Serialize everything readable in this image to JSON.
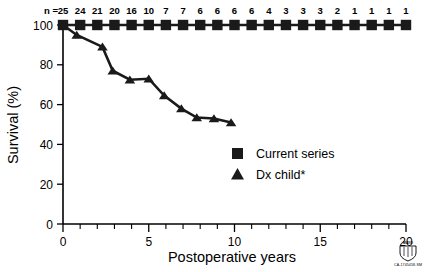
{
  "chart_data": {
    "type": "line",
    "title": "",
    "xlabel": "Postoperative years",
    "ylabel": "Survival (%)",
    "xlim": [
      0,
      20
    ],
    "ylim": [
      0,
      100
    ],
    "x_ticks": [
      0,
      5,
      10,
      15,
      20
    ],
    "x_tick_labels": [
      "0",
      "5",
      "10",
      "15",
      "20"
    ],
    "x_minor_tick_step": 1,
    "y_ticks": [
      0,
      20,
      40,
      60,
      80,
      100
    ],
    "y_tick_labels": [
      "0",
      "20",
      "40",
      "60",
      "80",
      "100"
    ],
    "grid": false,
    "legend_position": "center-right",
    "risk_table_label": "n =",
    "risk_table_x": [
      0,
      1,
      2,
      3,
      4,
      5,
      6,
      7,
      8,
      9,
      10,
      11,
      12,
      13,
      14,
      15,
      16,
      17,
      18,
      19,
      20
    ],
    "risk_table_values": [
      "25",
      "24",
      "21",
      "20",
      "16",
      "10",
      "7",
      "7",
      "6",
      "6",
      "6",
      "6",
      "4",
      "3",
      "3",
      "3",
      "2",
      "1",
      "1",
      "1",
      "1"
    ],
    "series": [
      {
        "name": "Current series",
        "marker": "square",
        "color": "#1a1a1a",
        "x": [
          0,
          1,
          2,
          3,
          4,
          5,
          6,
          7,
          8,
          9,
          10,
          11,
          12,
          13,
          14,
          15,
          16,
          17,
          18,
          19,
          20
        ],
        "values": [
          100,
          100,
          100,
          100,
          100,
          100,
          100,
          100,
          100,
          100,
          100,
          100,
          100,
          100,
          100,
          100,
          100,
          100,
          100,
          100,
          100
        ]
      },
      {
        "name": "Dx child*",
        "marker": "triangle",
        "color": "#1a1a1a",
        "x": [
          0,
          0.8,
          2.3,
          2.9,
          3.9,
          5.0,
          5.9,
          6.9,
          7.8,
          8.8,
          9.8
        ],
        "values": [
          100,
          95,
          89,
          77,
          72.5,
          73,
          64.5,
          58,
          53.5,
          53,
          51
        ]
      }
    ]
  },
  "legend": {
    "items": [
      {
        "label": "Current series",
        "marker": "square"
      },
      {
        "label": "Dx child*",
        "marker": "triangle"
      }
    ]
  },
  "credit": {
    "logo_word": "MAYO",
    "code": "CA-1745458-SM"
  }
}
